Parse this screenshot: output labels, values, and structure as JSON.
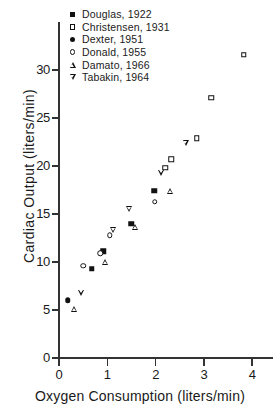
{
  "chart_data": {
    "type": "scatter",
    "title": "",
    "xlabel": "Oxygen Consumption (liters/min)",
    "ylabel": "Cardiac Output (liters/min)",
    "xlim": [
      0,
      4.25
    ],
    "ylim": [
      0,
      34
    ],
    "xticks": [
      "0",
      "1",
      "2",
      "3",
      "4"
    ],
    "xtick_values": [
      0,
      1,
      2,
      3,
      4
    ],
    "yticks": [
      "0",
      "5",
      "10",
      "15",
      "20",
      "25",
      "30"
    ],
    "ytick_values": [
      0,
      5,
      10,
      15,
      20,
      25,
      30
    ],
    "grid": false,
    "legend_position": "upper-left-inside",
    "series": [
      {
        "name": "Douglas, 1922",
        "marker": "filled-square",
        "points": [
          [
            0.68,
            9.3
          ],
          [
            0.92,
            11.1
          ],
          [
            1.5,
            14.0
          ],
          [
            1.97,
            17.4
          ]
        ]
      },
      {
        "name": "Christensen, 1931",
        "marker": "open-square",
        "points": [
          [
            2.2,
            19.8
          ],
          [
            2.32,
            20.7
          ],
          [
            2.85,
            22.9
          ],
          [
            3.15,
            27.1
          ],
          [
            3.83,
            31.6
          ]
        ]
      },
      {
        "name": "Dexter, 1951",
        "marker": "filled-circle",
        "points": [
          [
            0.18,
            6.0
          ]
        ]
      },
      {
        "name": "Donald, 1955",
        "marker": "open-circle",
        "points": [
          [
            0.5,
            9.6
          ],
          [
            0.85,
            10.9
          ],
          [
            1.05,
            12.8
          ],
          [
            1.98,
            16.3
          ]
        ]
      },
      {
        "name": "Damato, 1966",
        "marker": "open-triangle-up",
        "points": [
          [
            0.32,
            5.1
          ],
          [
            0.95,
            10.0
          ],
          [
            1.57,
            13.6
          ],
          [
            2.3,
            17.4
          ]
        ]
      },
      {
        "name": "Tabakin, 1964",
        "marker": "open-triangle-down",
        "points": [
          [
            0.45,
            6.8
          ],
          [
            1.12,
            13.3
          ],
          [
            1.45,
            15.5
          ],
          [
            2.12,
            19.3
          ],
          [
            2.62,
            22.4
          ]
        ]
      }
    ]
  },
  "legend": {
    "entries": [
      {
        "label": "Douglas, 1922",
        "marker": "filled-square"
      },
      {
        "label": "Christensen, 1931",
        "marker": "open-square"
      },
      {
        "label": "Dexter, 1951",
        "marker": "filled-circle"
      },
      {
        "label": "Donald, 1955",
        "marker": "open-circle"
      },
      {
        "label": "Damato, 1966",
        "marker": "open-triangle-up"
      },
      {
        "label": "Tabakin, 1964",
        "marker": "open-triangle-down"
      }
    ]
  },
  "colors": {
    "ink": "#111111",
    "axis": "#333333",
    "background": "#ffffff"
  }
}
